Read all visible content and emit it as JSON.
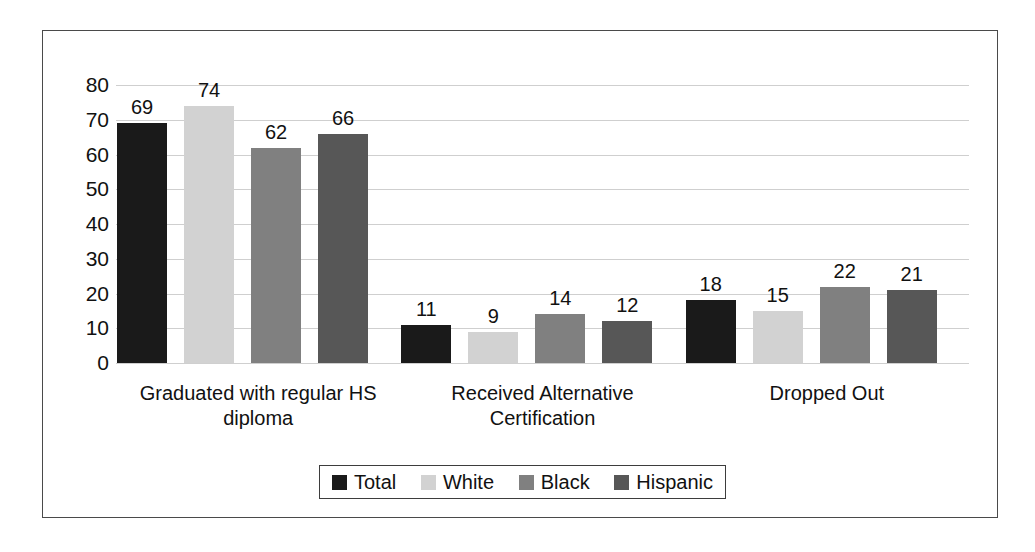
{
  "chart_data": {
    "type": "bar",
    "title": "",
    "subtitle": "",
    "xlabel": "",
    "ylabel": "",
    "ylim": [
      0,
      80
    ],
    "ytick_labels": [
      "80",
      "70",
      "60",
      "50",
      "40",
      "30",
      "20",
      "10",
      "0"
    ],
    "ytick_values": [
      80,
      70,
      60,
      50,
      40,
      30,
      20,
      10,
      0
    ],
    "grid": true,
    "legend_position": "bottom",
    "categories": [
      "Graduated with regular HS diploma",
      "Received Alternative Certification",
      "Dropped Out"
    ],
    "category_lines": [
      [
        "Graduated with regular HS",
        "diploma"
      ],
      [
        "Received Alternative",
        "Certification"
      ],
      [
        "Dropped Out"
      ]
    ],
    "series": [
      {
        "name": "Total",
        "color": "#1a1a1a",
        "values": [
          69,
          74,
          62
        ]
      },
      {
        "name": "White",
        "color": "#d2d2d2",
        "values": [
          11,
          9,
          14
        ]
      },
      {
        "name": "Black",
        "color": "#808080",
        "values": [
          18,
          15,
          22
        ]
      },
      {
        "name": "Hispanic",
        "color": "#575757",
        "values": [
          21,
          12,
          66
        ]
      }
    ],
    "groups": [
      {
        "category": "Graduated with regular HS diploma",
        "bars": [
          {
            "series": "Total",
            "value": 69,
            "label": "69",
            "color": "#1a1a1a"
          },
          {
            "series": "White",
            "value": 74,
            "label": "74",
            "color": "#d2d2d2"
          },
          {
            "series": "Black",
            "value": 62,
            "label": "62",
            "color": "#808080"
          },
          {
            "series": "Hispanic",
            "value": 66,
            "label": "66",
            "color": "#575757"
          }
        ]
      },
      {
        "category": "Received Alternative Certification",
        "bars": [
          {
            "series": "Total",
            "value": 11,
            "label": "11",
            "color": "#1a1a1a"
          },
          {
            "series": "White",
            "value": 9,
            "label": "9",
            "color": "#d2d2d2"
          },
          {
            "series": "Black",
            "value": 14,
            "label": "14",
            "color": "#808080"
          },
          {
            "series": "Hispanic",
            "value": 12,
            "label": "12",
            "color": "#575757"
          }
        ]
      },
      {
        "category": "Dropped Out",
        "bars": [
          {
            "series": "Total",
            "value": 18,
            "label": "18",
            "color": "#1a1a1a"
          },
          {
            "series": "White",
            "value": 15,
            "label": "15",
            "color": "#d2d2d2"
          },
          {
            "series": "Black",
            "value": 22,
            "label": "22",
            "color": "#808080"
          },
          {
            "series": "Hispanic",
            "value": 21,
            "label": "21",
            "color": "#575757"
          }
        ]
      }
    ]
  },
  "legend": {
    "entries": [
      {
        "label": "Total",
        "color": "#1a1a1a"
      },
      {
        "label": "White",
        "color": "#d2d2d2"
      },
      {
        "label": "Black",
        "color": "#808080"
      },
      {
        "label": "Hispanic",
        "color": "#575757"
      }
    ]
  },
  "colors": {
    "frame_border": "#4a4a4a",
    "gridline": "#cfcfcf",
    "text": "#111111",
    "background": "#ffffff",
    "legend_border": "#3d3d3d"
  }
}
